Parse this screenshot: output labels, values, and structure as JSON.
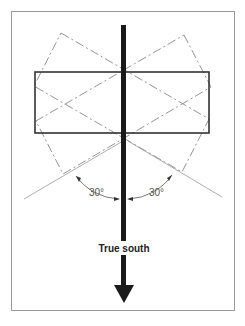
{
  "diagram": {
    "type": "solar-orientation",
    "labels": {
      "direction": "True south",
      "angle_left": "30°",
      "angle_right": "30°"
    },
    "colors": {
      "frame": "#999999",
      "building": "#333333",
      "arrow": "#1a1a1a",
      "rotated": "#888888",
      "text": "#333333"
    },
    "tilt_degrees": 30
  }
}
